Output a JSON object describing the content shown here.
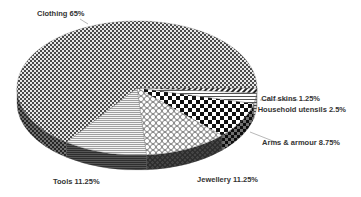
{
  "chart_data": {
    "type": "pie",
    "style": "3d",
    "title": "",
    "categories": [
      "Clothing",
      "Calf skins",
      "Household utensils",
      "Arms & armour",
      "Jewellery",
      "Tools"
    ],
    "values": [
      65,
      1.25,
      2.5,
      8.75,
      11.25,
      11.25
    ],
    "unit": "%",
    "labels": [
      {
        "name": "Clothing",
        "value": "65%",
        "text": "Clothing 65%"
      },
      {
        "name": "Calf skins",
        "value": "1.25%",
        "text": "Calf skins 1.25%"
      },
      {
        "name": "Household utensils",
        "value": "2.5%",
        "text": "Household utensils 2.5%"
      },
      {
        "name": "Arms & armour",
        "value": "8.75%",
        "text": "Arms & armour 8.75%"
      },
      {
        "name": "Jewellery",
        "value": "11.25%",
        "text": "Jewellery 11.25%"
      },
      {
        "name": "Tools",
        "value": "11.25%",
        "text": "Tools 11.25%"
      }
    ],
    "legend": "none (data labels with leader lines)",
    "colors": "monochrome hatch patterns"
  },
  "geometry": {
    "cx": 137,
    "cy": 88,
    "rx": 120,
    "ry": 67,
    "depth": 15,
    "start_angle": 0,
    "slices_order_clockwise": [
      "Calf skins",
      "Household utensils",
      "Arms & armour",
      "Jewellery",
      "Tools",
      "Clothing"
    ]
  }
}
